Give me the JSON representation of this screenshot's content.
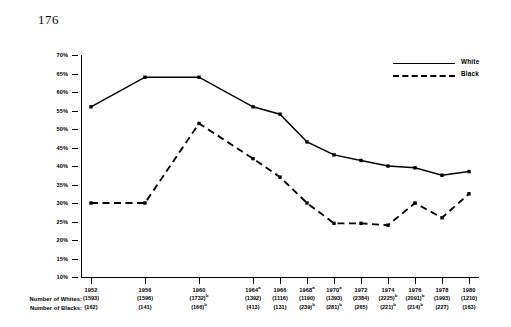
{
  "page_number": "176",
  "legend": {
    "position": "top-right",
    "entries": [
      {
        "label": "White",
        "style": "solid"
      },
      {
        "label": "Black",
        "style": "dashed"
      }
    ]
  },
  "row_labels": {
    "whites": "Number of Whites:",
    "blacks": "Number of Blacks:"
  },
  "chart_data": {
    "type": "line",
    "title": "",
    "subtitle": "",
    "xlabel": "",
    "ylabel": "",
    "grid": false,
    "ylim": [
      10,
      70
    ],
    "ytick_labels": [
      "70%",
      "65%",
      "60%",
      "55%",
      "50%",
      "45%",
      "40%",
      "35%",
      "30%",
      "25%",
      "20%",
      "15%",
      "10%"
    ],
    "ytick_values": [
      70,
      65,
      60,
      55,
      50,
      45,
      40,
      35,
      30,
      25,
      20,
      15,
      10
    ],
    "categories": [
      "1952",
      "1956",
      "1960",
      "1964",
      "1966",
      "1968",
      "1970",
      "1972",
      "1974",
      "1976",
      "1978",
      "1980"
    ],
    "category_superscripts": [
      "",
      "",
      "",
      "a",
      "",
      "a",
      "a",
      "",
      "",
      "",
      "",
      ""
    ],
    "x_positions": [
      0,
      4,
      8,
      12,
      14,
      16,
      18,
      20,
      22,
      24,
      26,
      28
    ],
    "series": [
      {
        "name": "White",
        "style": "solid",
        "values": [
          56,
          64,
          64,
          56,
          54,
          46.5,
          43,
          41.5,
          40,
          39.5,
          37.5,
          38.5
        ]
      },
      {
        "name": "Black",
        "style": "dashed",
        "values": [
          30,
          30,
          51.5,
          42,
          37,
          30,
          24.5,
          24.5,
          24,
          30,
          26,
          32.5
        ]
      }
    ],
    "number_of_whites": [
      {
        "value": "(1593)",
        "sup": ""
      },
      {
        "value": "(1596)",
        "sup": ""
      },
      {
        "value": "(1732)",
        "sup": "b"
      },
      {
        "value": "(1392)",
        "sup": ""
      },
      {
        "value": "(1116)",
        "sup": ""
      },
      {
        "value": "(1190)",
        "sup": ""
      },
      {
        "value": "(1393)",
        "sup": ""
      },
      {
        "value": "(2384)",
        "sup": ""
      },
      {
        "value": "(2225)",
        "sup": "b"
      },
      {
        "value": "(2091)",
        "sup": "b"
      },
      {
        "value": "(1993)",
        "sup": ""
      },
      {
        "value": "(1210)",
        "sup": ""
      }
    ],
    "number_of_blacks": [
      {
        "value": "(162)",
        "sup": ""
      },
      {
        "value": "(141)",
        "sup": ""
      },
      {
        "value": "(166)",
        "sup": "b"
      },
      {
        "value": "(413)",
        "sup": ""
      },
      {
        "value": "(131)",
        "sup": ""
      },
      {
        "value": "(239)",
        "sup": "b"
      },
      {
        "value": "(281)",
        "sup": "b"
      },
      {
        "value": "(265)",
        "sup": ""
      },
      {
        "value": "(221)",
        "sup": "b"
      },
      {
        "value": "(214)",
        "sup": "b"
      },
      {
        "value": "(227)",
        "sup": ""
      },
      {
        "value": "(163)",
        "sup": ""
      }
    ]
  }
}
